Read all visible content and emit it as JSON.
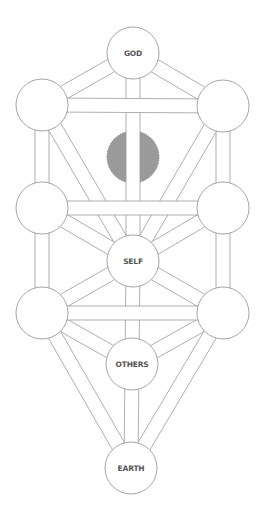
{
  "diagram": {
    "colors": {
      "background": "#ffffff",
      "outline": "#9b9b9b",
      "hidden_node_fill": "#9a9a9a",
      "label": "#555555"
    },
    "nodes": [
      {
        "id": "god",
        "label": "GOD",
        "cx": 133,
        "cy": 53,
        "r": 26
      },
      {
        "id": "upper-left",
        "label": "",
        "cx": 42,
        "cy": 105,
        "r": 26
      },
      {
        "id": "upper-right",
        "label": "",
        "cx": 223,
        "cy": 106,
        "r": 26
      },
      {
        "id": "hidden",
        "label": "",
        "cx": 133,
        "cy": 157,
        "r": 26,
        "filled": true
      },
      {
        "id": "middle-left",
        "label": "",
        "cx": 42,
        "cy": 208,
        "r": 26
      },
      {
        "id": "middle-right",
        "label": "",
        "cx": 223,
        "cy": 208,
        "r": 26
      },
      {
        "id": "self",
        "label": "SELF",
        "cx": 133,
        "cy": 261,
        "r": 26
      },
      {
        "id": "lower-left",
        "label": "",
        "cx": 42,
        "cy": 313,
        "r": 26
      },
      {
        "id": "lower-right",
        "label": "",
        "cx": 223,
        "cy": 313,
        "r": 26
      },
      {
        "id": "others",
        "label": "OTHERS",
        "cx": 132,
        "cy": 364,
        "r": 26
      },
      {
        "id": "earth",
        "label": "EARTH",
        "cx": 131,
        "cy": 468,
        "r": 26
      }
    ],
    "labels": {
      "god": "GOD",
      "self": "SELF",
      "others": "OTHERS",
      "earth": "EARTH"
    },
    "paths": [
      [
        "god",
        "upper-left"
      ],
      [
        "god",
        "upper-right"
      ],
      [
        "god",
        "self"
      ],
      [
        "upper-left",
        "middle-left"
      ],
      [
        "upper-left",
        "self"
      ],
      [
        "upper-right",
        "middle-right"
      ],
      [
        "upper-right",
        "self"
      ],
      [
        "middle-left",
        "self"
      ],
      [
        "middle-right",
        "self"
      ],
      [
        "middle-left",
        "lower-left"
      ],
      [
        "middle-right",
        "lower-right"
      ],
      [
        "self",
        "lower-left"
      ],
      [
        "self",
        "lower-right"
      ],
      [
        "self",
        "others"
      ],
      [
        "lower-left",
        "others"
      ],
      [
        "lower-right",
        "others"
      ],
      [
        "lower-left",
        "earth"
      ],
      [
        "lower-right",
        "earth"
      ],
      [
        "others",
        "earth"
      ],
      [
        "upper-left",
        "upper-right"
      ],
      [
        "middle-left",
        "middle-right"
      ],
      [
        "lower-left",
        "lower-right"
      ]
    ],
    "path_width": 14
  }
}
